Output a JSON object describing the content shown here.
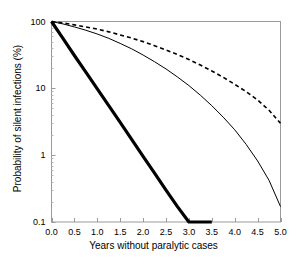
{
  "chart_data": {
    "type": "line",
    "title": "",
    "subtitle": "",
    "xlabel": "Years without paralytic cases",
    "ylabel": "Probability of silent infections (%)",
    "xscale": "linear",
    "yscale": "log",
    "xlim": [
      0.0,
      5.0
    ],
    "ylim": [
      0.1,
      100
    ],
    "grid": false,
    "legend": "none",
    "xticks": [
      0.0,
      0.5,
      1.0,
      1.5,
      2.0,
      2.5,
      3.0,
      3.5,
      4.0,
      4.5,
      5.0
    ],
    "xtick_labels": [
      "0.0",
      "0.5",
      "1.0",
      "1.5",
      "2.0",
      "2.5",
      "3.0",
      "3.5",
      "4.0",
      "4.5",
      "5.0"
    ],
    "yticks": [
      100,
      10,
      1,
      0.1
    ],
    "ytick_labels": [
      "100",
      "10",
      "1",
      "0.1"
    ],
    "x": [
      0.0,
      0.25,
      0.5,
      0.75,
      1.0,
      1.25,
      1.5,
      1.75,
      2.0,
      2.25,
      2.5,
      2.75,
      3.0,
      3.25,
      3.5,
      3.75,
      4.0,
      4.25,
      4.5,
      4.75,
      5.0
    ],
    "series": [
      {
        "name": "thick-solid-curve",
        "style": "solid",
        "linewidth": 3.2,
        "color": "#000000",
        "values": [
          100,
          56,
          31,
          17.5,
          9.8,
          5.5,
          3.1,
          1.72,
          0.96,
          0.54,
          0.3,
          0.17,
          0.094,
          0.053,
          0.1,
          null,
          null,
          null,
          null,
          null,
          null
        ],
        "endpoint": {
          "x": 3.5,
          "y": 0.1
        }
      },
      {
        "name": "thin-solid-curve",
        "style": "solid",
        "linewidth": 1.0,
        "color": "#000000",
        "values": [
          100,
          92,
          83,
          74,
          65,
          56,
          47,
          39,
          31.5,
          25,
          19.5,
          14.8,
          11.0,
          7.9,
          5.5,
          3.7,
          2.4,
          1.45,
          0.82,
          0.42,
          0.17
        ],
        "endpoint": {
          "x": 5.0,
          "y": 0.17
        }
      },
      {
        "name": "dashed-curve",
        "style": "dashed",
        "linewidth": 1.6,
        "color": "#000000",
        "dash_pattern": "4,3",
        "values": [
          100,
          95,
          89,
          83,
          77,
          70,
          63,
          56.5,
          50,
          43.5,
          37.5,
          32,
          27,
          22.3,
          18.2,
          14.6,
          11.5,
          8.9,
          6.7,
          4.7,
          3.0
        ],
        "endpoint": {
          "x": 5.0,
          "y": 3.0
        }
      }
    ],
    "colors": {
      "axis": "#9a9a9a",
      "curve": "#000000",
      "background": "#ffffff",
      "text": "#000000"
    }
  }
}
